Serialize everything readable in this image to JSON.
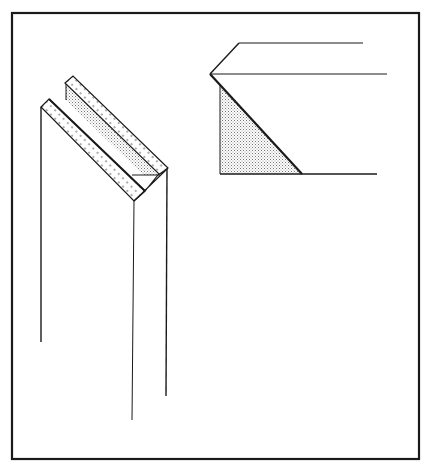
{
  "diagram": {
    "title": "",
    "colors": {
      "background": "#ffffff",
      "ink": "#1a1a1a",
      "stipple_fill": "#b8b8b8",
      "stipple_dot": "#555555"
    },
    "frame": {
      "x": 12,
      "y": 13,
      "width": 407,
      "height": 446
    },
    "figures": [
      {
        "name": "isometric-miter-board",
        "label": "",
        "front_strip": [
          [
            42,
            106
          ],
          [
            49,
            99
          ],
          [
            145,
            191
          ],
          [
            138,
            198
          ]
        ],
        "front_face_top": [
          [
            49,
            99
          ],
          [
            145,
            191
          ]
        ],
        "back_strip": [
          [
            65,
            83
          ],
          [
            73,
            76
          ],
          [
            168,
            168
          ],
          [
            161,
            175
          ]
        ],
        "shaded_bevel": [
          [
            65,
            86
          ],
          [
            65,
            101
          ],
          [
            157,
            176
          ],
          [
            161,
            175
          ]
        ],
        "tip_triangle": [
          [
            134,
            201
          ],
          [
            145,
            191
          ],
          [
            161,
            175
          ],
          [
            168,
            168
          ],
          [
            166,
            170
          ]
        ],
        "verticals": [
          {
            "x": 41,
            "y1": 107,
            "y2": 342
          },
          {
            "x": 133,
            "y1": 201,
            "y2": 420
          },
          {
            "x": 166,
            "y1": 169,
            "y2": 396
          }
        ]
      },
      {
        "name": "miter-end-section",
        "label": "",
        "apex": [
          210,
          74
        ],
        "top_edge": [
          [
            239,
            43
          ],
          [
            363,
            43
          ]
        ],
        "middle_edge": [
          [
            210,
            74
          ],
          [
            387,
            74
          ]
        ],
        "bottom_edge": [
          [
            220,
            174
          ],
          [
            377,
            174
          ]
        ],
        "back_slope": [
          [
            210,
            74
          ],
          [
            239,
            43
          ]
        ],
        "diagonal_cut": [
          [
            210,
            74
          ],
          [
            302,
            174
          ]
        ],
        "shaded_triangle": [
          [
            220,
            84
          ],
          [
            220,
            174
          ],
          [
            302,
            174
          ]
        ]
      }
    ]
  }
}
